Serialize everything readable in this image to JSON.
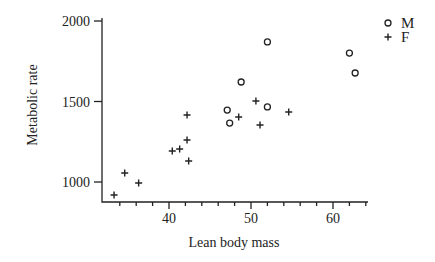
{
  "chart_data": {
    "type": "scatter",
    "title": "",
    "xlabel": "Lean body mass",
    "ylabel": "Metabolic rate",
    "xlim": [
      32,
      64
    ],
    "ylim": [
      880,
      2010
    ],
    "x_ticks": [
      40,
      50,
      60
    ],
    "x_minor_step": 2,
    "y_ticks": [
      1000,
      1500,
      2000
    ],
    "grid": false,
    "legend_position": "top-right",
    "series": [
      {
        "name": "M",
        "marker": "circle-open",
        "points": [
          {
            "x": 47.1,
            "y": 1447
          },
          {
            "x": 47.4,
            "y": 1366
          },
          {
            "x": 48.8,
            "y": 1621
          },
          {
            "x": 52.0,
            "y": 1466
          },
          {
            "x": 52.0,
            "y": 1870
          },
          {
            "x": 62.0,
            "y": 1801
          },
          {
            "x": 62.7,
            "y": 1677
          }
        ]
      },
      {
        "name": "F",
        "marker": "plus",
        "points": [
          {
            "x": 33.3,
            "y": 919
          },
          {
            "x": 34.6,
            "y": 1056
          },
          {
            "x": 36.3,
            "y": 994
          },
          {
            "x": 40.4,
            "y": 1193
          },
          {
            "x": 41.3,
            "y": 1205
          },
          {
            "x": 42.2,
            "y": 1416
          },
          {
            "x": 42.2,
            "y": 1261
          },
          {
            "x": 42.4,
            "y": 1130
          },
          {
            "x": 48.5,
            "y": 1404
          },
          {
            "x": 50.6,
            "y": 1503
          },
          {
            "x": 51.1,
            "y": 1354
          },
          {
            "x": 54.6,
            "y": 1435
          }
        ]
      }
    ]
  },
  "colors": {
    "ink": "#222222",
    "background": "#ffffff"
  }
}
